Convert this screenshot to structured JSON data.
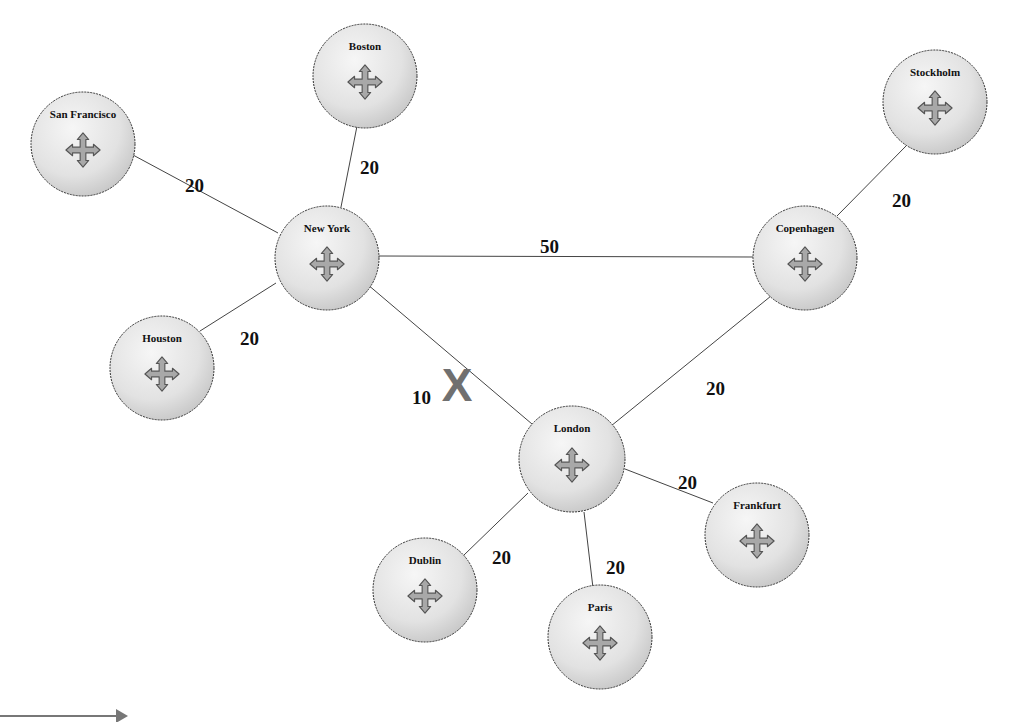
{
  "diagram": {
    "type": "network-topology",
    "colors": {
      "node_fill_light": "#f4f4f4",
      "node_fill_dark": "#c8c8c8",
      "node_stroke": "#333333",
      "edge": "#444444",
      "move_icon_fill": "#a8a8a8",
      "failure_mark": "#707070",
      "arrow": "#777777"
    },
    "nodes": [
      {
        "id": "boston",
        "label": "Boston",
        "x": 365,
        "y": 76,
        "r": 52
      },
      {
        "id": "san_francisco",
        "label": "San Francisco",
        "x": 83,
        "y": 144,
        "r": 52
      },
      {
        "id": "new_york",
        "label": "New York",
        "x": 327,
        "y": 258,
        "r": 52
      },
      {
        "id": "houston",
        "label": "Houston",
        "x": 162,
        "y": 368,
        "r": 52
      },
      {
        "id": "copenhagen",
        "label": "Copenhagen",
        "x": 805,
        "y": 258,
        "r": 52
      },
      {
        "id": "stockholm",
        "label": "Stockholm",
        "x": 935,
        "y": 102,
        "r": 52
      },
      {
        "id": "london",
        "label": "London",
        "x": 572,
        "y": 459,
        "r": 53
      },
      {
        "id": "frankfurt",
        "label": "Frankfurt",
        "x": 757,
        "y": 535,
        "r": 52
      },
      {
        "id": "dublin",
        "label": "Dublin",
        "x": 425,
        "y": 590,
        "r": 52
      },
      {
        "id": "paris",
        "label": "Paris",
        "x": 600,
        "y": 637,
        "r": 52
      }
    ],
    "edges": [
      {
        "from": "boston",
        "to": "new_york",
        "weight": "20",
        "x1": 358,
        "y1": 121,
        "x2": 341,
        "y2": 207,
        "lx": 360,
        "ly": 160
      },
      {
        "from": "san_francisco",
        "to": "new_york",
        "weight": "20",
        "x1": 133,
        "y1": 155,
        "x2": 278,
        "y2": 233,
        "lx": 185,
        "ly": 178
      },
      {
        "from": "houston",
        "to": "new_york",
        "weight": "20",
        "x1": 200,
        "y1": 331,
        "x2": 276,
        "y2": 283,
        "lx": 240,
        "ly": 331
      },
      {
        "from": "new_york",
        "to": "copenhagen",
        "weight": "50",
        "x1": 378,
        "y1": 256,
        "x2": 753,
        "y2": 257,
        "lx": 540,
        "ly": 239
      },
      {
        "from": "new_york",
        "to": "london",
        "weight": "10",
        "x1": 367,
        "y1": 284,
        "x2": 532,
        "y2": 424,
        "lx": 412,
        "ly": 390,
        "failed": true
      },
      {
        "from": "copenhagen",
        "to": "stockholm",
        "weight": "20",
        "x1": 837,
        "y1": 216,
        "x2": 906,
        "y2": 146,
        "lx": 892,
        "ly": 193
      },
      {
        "from": "copenhagen",
        "to": "london",
        "weight": "20",
        "x1": 771,
        "y1": 296,
        "x2": 611,
        "y2": 426,
        "lx": 706,
        "ly": 381
      },
      {
        "from": "london",
        "to": "frankfurt",
        "weight": "20",
        "x1": 625,
        "y1": 469,
        "x2": 713,
        "y2": 503,
        "lx": 678,
        "ly": 475
      },
      {
        "from": "london",
        "to": "dublin",
        "weight": "20",
        "x1": 528,
        "y1": 493,
        "x2": 464,
        "y2": 555,
        "lx": 492,
        "ly": 550
      },
      {
        "from": "london",
        "to": "paris",
        "weight": "20",
        "x1": 584,
        "y1": 512,
        "x2": 593,
        "y2": 588,
        "lx": 606,
        "ly": 560
      }
    ],
    "failure_mark": {
      "label": "X",
      "x": 457,
      "y": 383,
      "on_edge": "new_york-london"
    },
    "arrow": {
      "x1": 0,
      "y1": 716,
      "x2": 128,
      "y2": 716
    }
  }
}
